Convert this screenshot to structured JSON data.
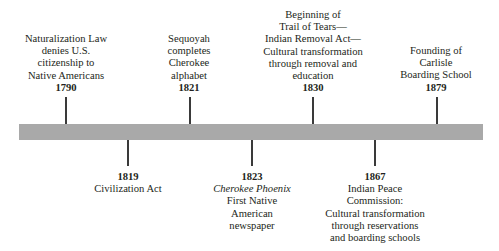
{
  "timeline": {
    "bar_color": "#a9a9a9",
    "tick_color": "#3a3a3a",
    "events_above": [
      {
        "year": "1790",
        "lines": [
          "Naturalization Law",
          "denies U.S.",
          "citizenship to",
          "Native Americans"
        ],
        "x": 66
      },
      {
        "year": "1821",
        "lines": [
          "Sequoyah",
          "completes",
          "Cherokee",
          "alphabet"
        ],
        "x": 189
      },
      {
        "year": "1830",
        "lines": [
          "Beginning of",
          "Trail of Tears—",
          "Indian Removal Act—",
          "Cultural transformation",
          "through removal and",
          "education"
        ],
        "x": 313
      },
      {
        "year": "1879",
        "lines": [
          "Founding of",
          "Carlisle",
          "Boarding School"
        ],
        "x": 436
      }
    ],
    "events_below": [
      {
        "year": "1819",
        "italic": "",
        "lines": [
          "Civilization Act"
        ],
        "x": 127
      },
      {
        "year": "1823",
        "italic": "Cherokee Phoenix",
        "lines": [
          "First Native",
          "American",
          "newspaper"
        ],
        "x": 252
      },
      {
        "year": "1867",
        "italic": "",
        "lines": [
          "Indian Peace",
          "Commission:",
          "Cultural transformation",
          "through reservations",
          "and boarding schools"
        ],
        "x": 374
      }
    ]
  }
}
